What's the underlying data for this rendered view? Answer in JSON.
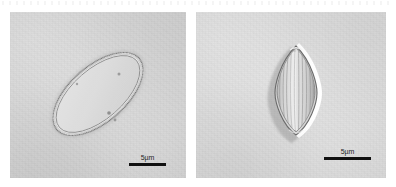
{
  "figure": {
    "type": "light-micrograph-figure",
    "panel_count": 2,
    "background_color": "#ffffff"
  },
  "panels": [
    {
      "id": "panel-left",
      "position": "left",
      "background_color": "#d4d4d4",
      "specimen": {
        "name": "elliptical-frustule-valve-view",
        "shape": "ellipse",
        "orientation_deg": -41,
        "ornamentation": "transverse-striae",
        "stria_count": 30,
        "outline_color": "#6f6f6f",
        "fill_color": "#dadada"
      },
      "scalebar": {
        "label": "5µm",
        "bar_color": "#111111",
        "bar_length_px": 37,
        "value": 5,
        "unit": "µm"
      }
    },
    {
      "id": "panel-right",
      "position": "right",
      "background_color": "#dadada",
      "specimen": {
        "name": "lenticular-frustule-girdle-view",
        "shape": "lemon-lenticular",
        "orientation_deg": 0,
        "ornamentation": "longitudinal-ribs",
        "rib_count": 11,
        "outline_color": "#707070",
        "fill_color": "#d9d9d9",
        "halo_color": "#f6f6f6"
      },
      "scalebar": {
        "label": "5µm",
        "bar_color": "#111111",
        "bar_length_px": 47,
        "value": 5,
        "unit": "µm"
      }
    }
  ]
}
